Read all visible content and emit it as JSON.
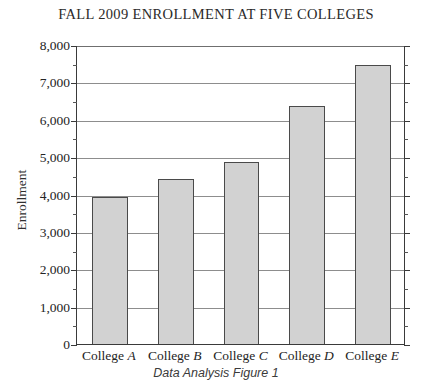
{
  "chart_data": {
    "type": "bar",
    "title": "FALL 2009 ENROLLMENT AT FIVE COLLEGES",
    "caption": "Data Analysis Figure 1",
    "xlabel": "",
    "ylabel": "Enrollment",
    "ylim": [
      0,
      8000
    ],
    "ytick_step": 1000,
    "yminor_step": 500,
    "grid": true,
    "legend": null,
    "categories": [
      "College A",
      "College B",
      "College C",
      "College D",
      "College E"
    ],
    "category_prefix": "College",
    "category_letters": [
      "A",
      "B",
      "C",
      "D",
      "E"
    ],
    "values": [
      3950,
      4450,
      4900,
      6400,
      7500
    ],
    "ytick_labels": [
      "0",
      "1,000",
      "2,000",
      "3,000",
      "4,000",
      "5,000",
      "6,000",
      "7,000",
      "8,000"
    ],
    "ytick_values": [
      0,
      1000,
      2000,
      3000,
      4000,
      5000,
      6000,
      7000,
      8000
    ],
    "bar_fill_color": "#d2d2d2",
    "bar_border_color": "#4a4a4a",
    "gridline_color": "#8d8d8d",
    "axis_color": "#3a3a3a"
  }
}
